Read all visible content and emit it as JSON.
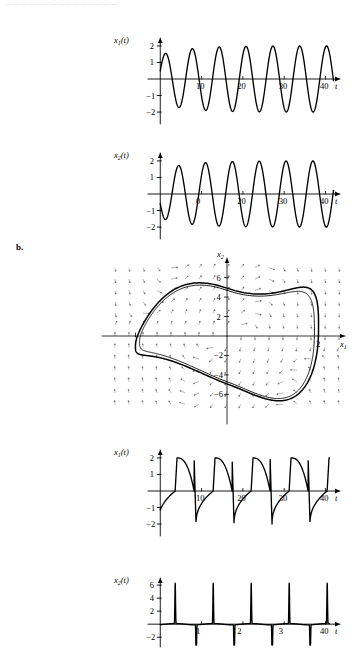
{
  "header": {
    "running_text": "— — — — — — — — — — — — — — —"
  },
  "parts": {
    "b_label": "b."
  },
  "axis_labels": {
    "x1_of_t": "x",
    "x2_of_t": "x",
    "sub_1": "1",
    "sub_2": "2",
    "paren_t": "(t)",
    "t": "t",
    "x1": "x",
    "x2": "x"
  },
  "chart_data": [
    {
      "id": "panel-a-x1",
      "type": "line",
      "title": "x₁(t)",
      "xlabel": "t",
      "ylabel": "x₁(t)",
      "xlim": [
        -2,
        44
      ],
      "ylim": [
        -2.6,
        2.6
      ],
      "xticks": [
        10,
        20,
        30,
        40
      ],
      "yticks": [
        2,
        1,
        -1,
        -2
      ],
      "xtick_labels": [
        "10",
        "20",
        "30",
        "40"
      ],
      "ytick_labels": [
        "2",
        "1",
        "−1",
        "−2"
      ],
      "grid": false,
      "legend": "none",
      "description": "Growing sinusoidal oscillation approaching limit-cycle amplitude 2",
      "waveform": {
        "kind": "sinusoid-envelope",
        "start_value": 1.0,
        "period": 6.5,
        "phase": 0.35,
        "amp_initial": 1.45,
        "amp_final": 2.0,
        "amp_growth": 0.55
      }
    },
    {
      "id": "panel-a-x2",
      "type": "line",
      "title": "x₂(t)",
      "xlabel": "t",
      "ylabel": "x₂(t)",
      "xlim": [
        -2,
        44
      ],
      "ylim": [
        -2.6,
        2.6
      ],
      "xticks": [
        10,
        20,
        30,
        40
      ],
      "yticks": [
        2,
        1,
        -1,
        -2
      ],
      "xtick_labels": [
        "0",
        "20",
        "30",
        "40"
      ],
      "ytick_labels": [
        "2",
        "1",
        "−1",
        "−2"
      ],
      "grid": false,
      "legend": "none",
      "description": "Growing sinusoidal oscillation starting near −1, amplitude approaching 2",
      "waveform": {
        "kind": "sinusoid-envelope",
        "start_value": -1.0,
        "period": 6.5,
        "phase": 3.55,
        "amp_initial": 1.45,
        "amp_final": 2.0,
        "amp_growth": 0.55
      }
    },
    {
      "id": "panel-b-phase",
      "type": "line",
      "title": "phase portrait with direction field",
      "xlabel": "x₁",
      "ylabel": "x₂",
      "xlim": [
        -2.6,
        2.6
      ],
      "ylim": [
        -7.6,
        7.6
      ],
      "xticks": [
        -2,
        2
      ],
      "yticks": [
        6,
        4,
        2,
        -2,
        -4,
        -6
      ],
      "xtick_labels": [
        "",
        "2"
      ],
      "ytick_labels": [
        "6",
        "4",
        "2",
        "−2",
        "−4",
        "−6"
      ],
      "grid": false,
      "legend": "none",
      "description": "Van der Pol relaxation limit cycle with vector-field arrow grid",
      "field": {
        "kind": "arrow-grid",
        "cols": 17,
        "rows": 13,
        "arrow_color": "#7a7a7a"
      },
      "cycle": {
        "kind": "relaxation-limit-cycle",
        "x_extent": 2.0,
        "y_peak": 6.3,
        "inner_offset": 0.22
      }
    },
    {
      "id": "panel-b-x1",
      "type": "line",
      "title": "x₁(t)",
      "xlabel": "t",
      "ylabel": "x₁(t)",
      "xlim": [
        -2,
        44
      ],
      "ylim": [
        -2.6,
        2.6
      ],
      "xticks": [
        10,
        20,
        30,
        40
      ],
      "yticks": [
        2,
        1,
        -1,
        -2
      ],
      "xtick_labels": [
        "10",
        "20",
        "30",
        "40"
      ],
      "ytick_labels": [
        "2",
        "1",
        "−1",
        "−2"
      ],
      "grid": false,
      "legend": "none",
      "description": "Relaxation oscillation: slow rise to +2, fast drop to −2, period about 9.2",
      "waveform": {
        "kind": "relaxation",
        "start_value": 1.0,
        "period": 9.2,
        "high": 2.0,
        "low": -2.0,
        "drop_fraction": 0.05
      }
    },
    {
      "id": "panel-b-x2",
      "type": "line",
      "title": "x₂(t)",
      "xlabel": "t",
      "ylabel": "x₂(t)",
      "xlim": [
        -2,
        44
      ],
      "ylim": [
        -3.2,
        7.4
      ],
      "xticks": [
        10,
        20,
        30,
        40
      ],
      "yticks": [
        6,
        4,
        2,
        -2
      ],
      "xtick_labels": [
        "1",
        "2",
        "3",
        "40"
      ],
      "ytick_labels": [
        "6",
        "4",
        "2",
        "−2"
      ],
      "grid": false,
      "legend": "none",
      "description": "Spike train: narrow positive spikes to +6 alternating with negative spikes below −2",
      "waveform": {
        "kind": "spike-train",
        "period": 9.2,
        "spike_high": 6.3,
        "spike_low": -6.0,
        "baseline": 0.0
      }
    }
  ]
}
